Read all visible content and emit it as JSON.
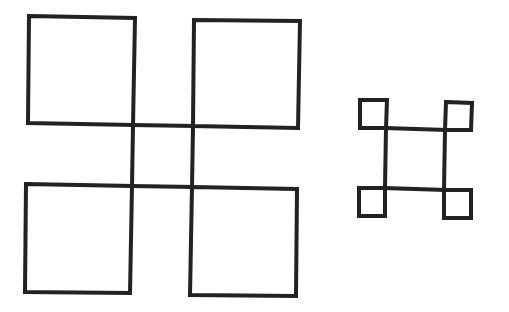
{
  "canvas": {
    "width": 509,
    "height": 312,
    "background": "#ffffff"
  },
  "style": {
    "stroke": "#222222",
    "stroke_width_large": 4,
    "stroke_width_small": 4
  },
  "figures": [
    {
      "name": "large-figure",
      "description": "Four large squares arranged 2x2 whose inner sides extend to form a central square",
      "squares": [
        {
          "name": "large-square-top-left",
          "points": [
            [
              29,
              16
            ],
            [
              135,
              18
            ],
            [
              133,
              125
            ],
            [
              28,
              123
            ]
          ]
        },
        {
          "name": "large-square-top-right",
          "points": [
            [
              194,
              20
            ],
            [
              300,
              21
            ],
            [
              298,
              128
            ],
            [
              193,
              126
            ]
          ]
        },
        {
          "name": "large-square-bottom-left",
          "points": [
            [
              26,
              184
            ],
            [
              132,
              186
            ],
            [
              130,
              293
            ],
            [
              25,
              292
            ]
          ]
        },
        {
          "name": "large-square-bottom-right",
          "points": [
            [
              192,
              187
            ],
            [
              297,
              189
            ],
            [
              296,
              296
            ],
            [
              190,
              295
            ]
          ]
        }
      ],
      "connectors": [
        {
          "name": "large-connector-top",
          "from": [
            133,
            125
          ],
          "to": [
            193,
            126
          ]
        },
        {
          "name": "large-connector-bottom",
          "from": [
            132,
            186
          ],
          "to": [
            192,
            187
          ]
        },
        {
          "name": "large-connector-left",
          "from": [
            133,
            125
          ],
          "to": [
            132,
            186
          ]
        },
        {
          "name": "large-connector-right",
          "from": [
            193,
            126
          ],
          "to": [
            192,
            187
          ]
        }
      ]
    },
    {
      "name": "small-figure",
      "description": "Four small squares at the corners of a larger central square",
      "squares": [
        {
          "name": "small-square-top-left",
          "points": [
            [
              360,
              100
            ],
            [
              387,
              100
            ],
            [
              386,
              128
            ],
            [
              360,
              128
            ]
          ]
        },
        {
          "name": "small-square-top-right",
          "points": [
            [
              446,
              102
            ],
            [
              472,
              103
            ],
            [
              471,
              130
            ],
            [
              445,
              130
            ]
          ]
        },
        {
          "name": "small-square-bottom-left",
          "points": [
            [
              359,
              188
            ],
            [
              385,
              188
            ],
            [
              385,
              216
            ],
            [
              359,
              216
            ]
          ]
        },
        {
          "name": "small-square-bottom-right",
          "points": [
            [
              444,
              190
            ],
            [
              471,
              190
            ],
            [
              471,
              218
            ],
            [
              444,
              218
            ]
          ]
        }
      ],
      "connectors": [
        {
          "name": "small-connector-top",
          "from": [
            386,
            128
          ],
          "to": [
            445,
            130
          ]
        },
        {
          "name": "small-connector-bottom",
          "from": [
            385,
            188
          ],
          "to": [
            444,
            190
          ]
        },
        {
          "name": "small-connector-left",
          "from": [
            386,
            128
          ],
          "to": [
            385,
            188
          ]
        },
        {
          "name": "small-connector-right",
          "from": [
            445,
            130
          ],
          "to": [
            444,
            190
          ]
        }
      ]
    }
  ]
}
